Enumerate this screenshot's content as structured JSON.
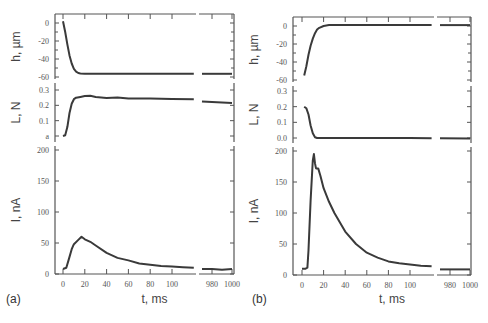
{
  "figure": {
    "panels": [
      {
        "id": "a",
        "label": "(a)",
        "xlabel": "t, ms"
      },
      {
        "id": "b",
        "label": "(b)",
        "xlabel": "t, ms"
      }
    ]
  },
  "chart_data": [
    {
      "panel": "(a)",
      "type": "line",
      "xlabel": "t, ms",
      "x_ticks": [
        0,
        20,
        40,
        60,
        80,
        100,
        980,
        1000
      ],
      "x_axis_break": [
        120,
        970
      ],
      "subplots": [
        {
          "ylabel": "h, µm",
          "yticks": [
            0,
            -20,
            -40,
            -60
          ],
          "ytick_labels": [
            "0",
            "-20",
            "-40",
            "-60"
          ],
          "ylim": [
            -62,
            8
          ],
          "x": [
            0,
            2,
            4,
            6,
            8,
            10,
            12,
            14,
            16,
            20,
            30,
            60,
            100,
            120,
            970,
            1000
          ],
          "y": [
            2,
            -10,
            -24,
            -36,
            -45,
            -51,
            -54,
            -55.5,
            -56,
            -56.5,
            -56.5,
            -56.5,
            -56.5,
            -56.5,
            -56.5,
            -56.5
          ]
        },
        {
          "ylabel": "L, N",
          "yticks": [
            0.3,
            0.2,
            0.1,
            0.0
          ],
          "ytick_labels": [
            "0.3",
            "0.2",
            "0.1",
            "a"
          ],
          "ylim": [
            -0.02,
            0.34
          ],
          "x": [
            0,
            2,
            4,
            6,
            8,
            10,
            12,
            16,
            20,
            25,
            30,
            40,
            50,
            60,
            80,
            100,
            120,
            970,
            1000
          ],
          "y": [
            0.0,
            0.005,
            0.06,
            0.15,
            0.21,
            0.24,
            0.25,
            0.255,
            0.26,
            0.262,
            0.255,
            0.248,
            0.252,
            0.245,
            0.245,
            0.242,
            0.24,
            0.225,
            0.215
          ]
        },
        {
          "ylabel": "I, nA",
          "yticks": [
            200,
            150,
            100,
            50,
            0
          ],
          "ytick_labels": [
            "200",
            "150",
            "100",
            "50",
            "0"
          ],
          "ylim": [
            0,
            205
          ],
          "x": [
            0,
            3,
            5,
            8,
            10,
            14,
            17,
            20,
            25,
            30,
            40,
            50,
            60,
            70,
            80,
            90,
            100,
            110,
            120,
            970,
            980,
            990,
            1000
          ],
          "y": [
            8,
            10,
            22,
            40,
            48,
            55,
            60,
            56,
            52,
            46,
            34,
            26,
            22,
            17,
            15,
            13,
            12,
            11,
            10,
            8,
            8,
            7,
            8
          ]
        }
      ]
    },
    {
      "panel": "(b)",
      "type": "line",
      "xlabel": "t, ms",
      "x_ticks": [
        0,
        20,
        40,
        60,
        80,
        100,
        980,
        1000
      ],
      "x_axis_break": [
        120,
        970
      ],
      "subplots": [
        {
          "ylabel": "h, µm",
          "yticks": [
            0,
            -20,
            -40,
            -60
          ],
          "ytick_labels": [
            "0",
            "-20",
            "-40",
            "-60"
          ],
          "ylim": [
            -62,
            8
          ],
          "x": [
            2,
            4,
            6,
            8,
            10,
            12,
            14,
            16,
            20,
            25,
            30,
            60,
            100,
            120,
            970,
            1000
          ],
          "y": [
            -55,
            -45,
            -32,
            -22,
            -14,
            -8,
            -4,
            -2,
            0,
            1,
            1,
            1,
            1,
            1,
            1,
            1
          ]
        },
        {
          "ylabel": "L, N",
          "yticks": [
            0.3,
            0.2,
            0.1,
            0.0
          ],
          "ytick_labels": [
            "0.3",
            "0.2",
            "0.1",
            "0.0"
          ],
          "ylim": [
            -0.02,
            0.34
          ],
          "x": [
            2,
            4,
            6,
            8,
            10,
            12,
            14,
            20,
            60,
            100,
            120,
            970,
            1000
          ],
          "y": [
            0.2,
            0.19,
            0.15,
            0.08,
            0.03,
            0.005,
            0.0,
            0.0,
            0.0,
            0.0,
            -0.002,
            -0.002,
            -0.004
          ]
        },
        {
          "ylabel": "I, nA",
          "yticks": [
            200,
            150,
            100,
            50,
            0
          ],
          "ytick_labels": [
            "200",
            "150",
            "100",
            "50",
            "0"
          ],
          "ylim": [
            0,
            205
          ],
          "x": [
            0,
            3,
            5,
            6,
            8,
            10,
            11,
            12,
            13,
            15,
            17,
            20,
            25,
            30,
            40,
            50,
            60,
            70,
            80,
            90,
            100,
            110,
            120,
            970,
            980,
            1000
          ],
          "y": [
            10,
            10,
            12,
            40,
            120,
            185,
            195,
            180,
            172,
            172,
            160,
            140,
            118,
            100,
            70,
            50,
            36,
            28,
            22,
            19,
            17,
            15,
            14,
            9,
            9,
            9
          ]
        }
      ]
    }
  ]
}
